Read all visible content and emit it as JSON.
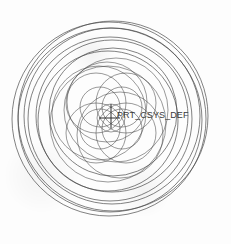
{
  "viewport": {
    "width": 231,
    "height": 244,
    "background_color": "#fdfdfd",
    "line_color": "#4a4a4a",
    "title": "CAD Sketch View"
  },
  "annotations": {
    "csys_label": "PRT_CSYS_DEF",
    "csys_marker": "coordinate-system-cross"
  },
  "chart_data": {
    "type": "scatter",
    "xlabel": "",
    "ylabel": "",
    "center": {
      "x": 111,
      "y": 118
    },
    "csys_marker": {
      "x": 111,
      "y": 118,
      "arm_up": 14,
      "arm_down": 10,
      "arm_left": 12,
      "arm_right": 9
    },
    "label_position": {
      "x": 117,
      "y": 110
    },
    "geometry_note": "Family of circles whose centers orbit the origin; radius grows with rotation angle, producing an expanding spiral of circles. Inner small circles form a four-petal rosette.",
    "circles": [
      {
        "cx": 111,
        "cy": 118,
        "r": 14,
        "center_angle": 0,
        "orbit": 0
      },
      {
        "cx": 100,
        "cy": 107,
        "r": 20,
        "center_angle": 225,
        "orbit": 15
      },
      {
        "cx": 122,
        "cy": 107,
        "r": 20,
        "center_angle": 315,
        "orbit": 15
      },
      {
        "cx": 122,
        "cy": 129,
        "r": 20,
        "center_angle": 45,
        "orbit": 15
      },
      {
        "cx": 100,
        "cy": 129,
        "r": 20,
        "center_angle": 135,
        "orbit": 15
      },
      {
        "cx": 96,
        "cy": 103,
        "r": 30,
        "center_angle": 225,
        "orbit": 21
      },
      {
        "cx": 126,
        "cy": 103,
        "r": 30,
        "center_angle": 315,
        "orbit": 21
      },
      {
        "cx": 126,
        "cy": 133,
        "r": 30,
        "center_angle": 45,
        "orbit": 21
      },
      {
        "cx": 96,
        "cy": 133,
        "r": 30,
        "center_angle": 135,
        "orbit": 21
      },
      {
        "cx": 107,
        "cy": 102,
        "r": 40,
        "center_angle": 260,
        "orbit": 17
      },
      {
        "cx": 120,
        "cy": 135,
        "r": 43,
        "center_angle": 70,
        "orbit": 19
      },
      {
        "cx": 99,
        "cy": 113,
        "r": 47,
        "center_angle": 200,
        "orbit": 13
      },
      {
        "cx": 116,
        "cy": 110,
        "r": 52,
        "center_angle": 330,
        "orbit": 9
      },
      {
        "cx": 108,
        "cy": 124,
        "r": 58,
        "center_angle": 110,
        "orbit": 7
      },
      {
        "cx": 113,
        "cy": 112,
        "r": 64,
        "center_angle": 300,
        "orbit": 6
      },
      {
        "cx": 108,
        "cy": 121,
        "r": 70,
        "center_angle": 100,
        "orbit": 4
      },
      {
        "cx": 112,
        "cy": 116,
        "r": 76,
        "center_angle": 320,
        "orbit": 3
      },
      {
        "cx": 110,
        "cy": 119,
        "r": 82,
        "center_angle": 120,
        "orbit": 2
      },
      {
        "cx": 112,
        "cy": 116,
        "r": 88,
        "center_angle": 320,
        "orbit": 4
      },
      {
        "cx": 110,
        "cy": 120,
        "r": 92,
        "center_angle": 110,
        "orbit": 3
      },
      {
        "cx": 113,
        "cy": 116,
        "r": 95,
        "center_angle": 315,
        "orbit": 4
      },
      {
        "cx": 109,
        "cy": 119,
        "r": 97,
        "center_angle": 130,
        "orbit": 3
      }
    ],
    "petal_rosette": {
      "petal_count": 4,
      "petal_radius": 22,
      "ring_radius": 22,
      "description": "four overlapping circles of equal radius centered on a ring around the origin"
    },
    "extents": {
      "left": 17,
      "right": 209,
      "top": 12,
      "bottom": 225
    },
    "grid": false,
    "legend": false
  }
}
